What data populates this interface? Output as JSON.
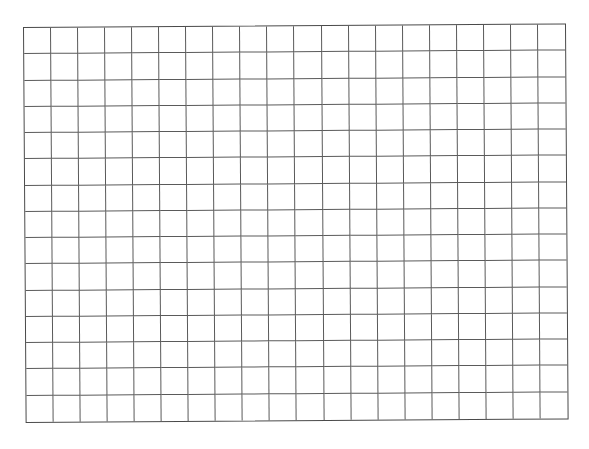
{
  "grid": {
    "columns": 20,
    "rows": 15,
    "line_color": "#555555",
    "background": "#ffffff"
  }
}
